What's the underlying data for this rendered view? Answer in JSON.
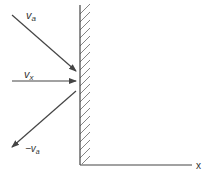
{
  "diagram": {
    "labels": {
      "va": "v",
      "va_sub": "a",
      "vx": "v",
      "vx_sub": "x",
      "neg_va_prefix": "−v",
      "neg_va_sub": "a",
      "x_axis": "x"
    },
    "colors": {
      "line": "#444444",
      "hatch": "#666666"
    }
  }
}
